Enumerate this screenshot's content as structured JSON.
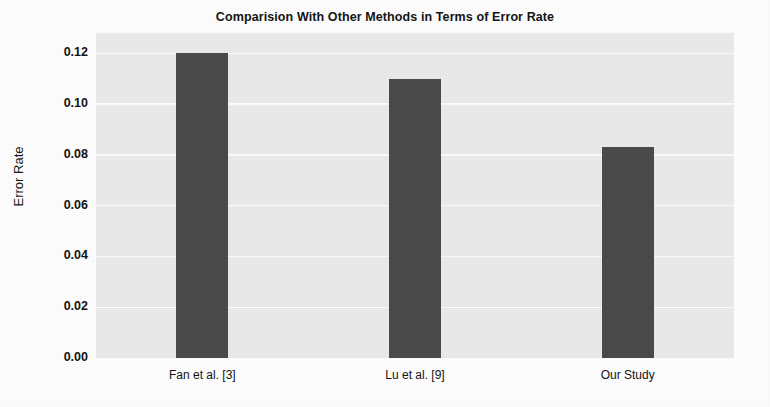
{
  "chart_data": {
    "type": "bar",
    "title": "Comparision With Other Methods in Terms of Error Rate",
    "xlabel": "",
    "ylabel": "Error Rate",
    "categories": [
      "Fan et al. [3]",
      "Lu et al. [9]",
      "Our Study"
    ],
    "values": [
      0.12,
      0.11,
      0.083
    ],
    "ylim": [
      0.0,
      0.128
    ],
    "yticks": [
      0.0,
      0.02,
      0.04,
      0.06,
      0.08,
      0.1,
      0.12
    ],
    "ytick_labels": [
      "0.00",
      "0.02",
      "0.04",
      "0.06",
      "0.08",
      "0.10",
      "0.12"
    ],
    "grid": "horizontal-only",
    "legend": "none",
    "colors": {
      "bar": "#4b4b4b",
      "plot_background": "#ececec",
      "gridline": "#fdfdfd",
      "figure_background": "#ffffff",
      "text": "#141414"
    }
  }
}
